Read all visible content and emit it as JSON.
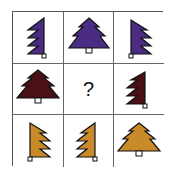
{
  "puzzle": {
    "title": "",
    "missing_label": "?",
    "colors": {
      "purple": "#4a2d82",
      "maroon": "#4a0f17",
      "gold": "#c98a2a",
      "outline": "#111111",
      "grid_line": "#666666"
    },
    "rows": [
      {
        "row": 1,
        "color": "purple",
        "cells": [
          {
            "shape": "half-tree-right",
            "label": "purple half tree (right half)"
          },
          {
            "shape": "full-tree",
            "label": "purple full tree"
          },
          {
            "shape": "half-tree-left",
            "label": "purple half tree (left half)"
          }
        ]
      },
      {
        "row": 2,
        "color": "maroon",
        "cells": [
          {
            "shape": "full-tree",
            "label": "maroon full tree"
          },
          {
            "shape": "missing",
            "label": "?"
          },
          {
            "shape": "half-tree-right",
            "label": "maroon half tree (right half)"
          }
        ]
      },
      {
        "row": 3,
        "color": "gold",
        "cells": [
          {
            "shape": "half-tree-left",
            "label": "gold half tree (left half)"
          },
          {
            "shape": "half-tree-right",
            "label": "gold half tree (right half)"
          },
          {
            "shape": "full-tree",
            "label": "gold full tree"
          }
        ]
      }
    ]
  }
}
